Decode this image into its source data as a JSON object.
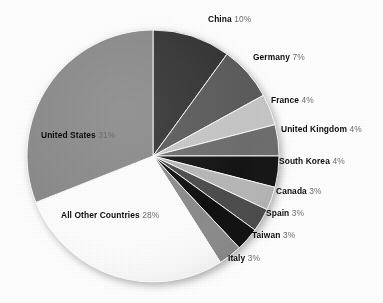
{
  "chart_data": {
    "type": "pie",
    "title": "",
    "subtitle": "",
    "xlabel": "",
    "ylabel": "",
    "legend_position": "none",
    "grid": false,
    "label_format": "{name} {value}%",
    "start_angle_deg": 0,
    "direction": "clockwise",
    "categories": [
      "China",
      "Germany",
      "France",
      "United Kingdom",
      "South Korea",
      "Canada",
      "Spain",
      "Taiwan",
      "Italy",
      "All Other Countries",
      "United States"
    ],
    "values": [
      10,
      7,
      4,
      4,
      4,
      3,
      3,
      3,
      3,
      28,
      31
    ],
    "slices": [
      {
        "name": "China",
        "value": 10,
        "value_text": "10%",
        "color": "#343434"
      },
      {
        "name": "Germany",
        "value": 7,
        "value_text": "7%",
        "color": "#5b5b5b"
      },
      {
        "name": "France",
        "value": 4,
        "value_text": "4%",
        "color": "#c6c6c6"
      },
      {
        "name": "United Kingdom",
        "value": 4,
        "value_text": "4%",
        "color": "#6d6d6d"
      },
      {
        "name": "South Korea",
        "value": 4,
        "value_text": "4%",
        "color": "#141414"
      },
      {
        "name": "Canada",
        "value": 3,
        "value_text": "3%",
        "color": "#b7b7b7"
      },
      {
        "name": "Spain",
        "value": 3,
        "value_text": "3%",
        "color": "#4c4c4c"
      },
      {
        "name": "Taiwan",
        "value": 3,
        "value_text": "3%",
        "color": "#101010"
      },
      {
        "name": "Italy",
        "value": 3,
        "value_text": "3%",
        "color": "#8c8c8c"
      },
      {
        "name": "All Other Countries",
        "value": 28,
        "value_text": "28%",
        "color": "#fdfdfd"
      },
      {
        "name": "United States",
        "value": 31,
        "value_text": "31%",
        "color": "#8a8a8a"
      }
    ]
  },
  "labels": {
    "china": {
      "name": "China",
      "value": "10%"
    },
    "germany": {
      "name": "Germany",
      "value": "7%"
    },
    "france": {
      "name": "France",
      "value": "4%"
    },
    "united_kingdom": {
      "name": "United Kingdom",
      "value": "4%"
    },
    "south_korea": {
      "name": "South Korea",
      "value": "4%"
    },
    "canada": {
      "name": "Canada",
      "value": "3%"
    },
    "spain": {
      "name": "Spain",
      "value": "3%"
    },
    "taiwan": {
      "name": "Taiwan",
      "value": "3%"
    },
    "italy": {
      "name": "Italy",
      "value": "3%"
    },
    "all_other_countries": {
      "name": "All Other Countries",
      "value": "28%"
    },
    "united_states": {
      "name": "United States",
      "value": "31%"
    }
  },
  "colors": {
    "background": "#ffffff",
    "label_text": "#0d0d0d",
    "value_text": "#6f6f6f",
    "slice_outline": "#ffffff",
    "shadow": "#b9b9b9"
  }
}
